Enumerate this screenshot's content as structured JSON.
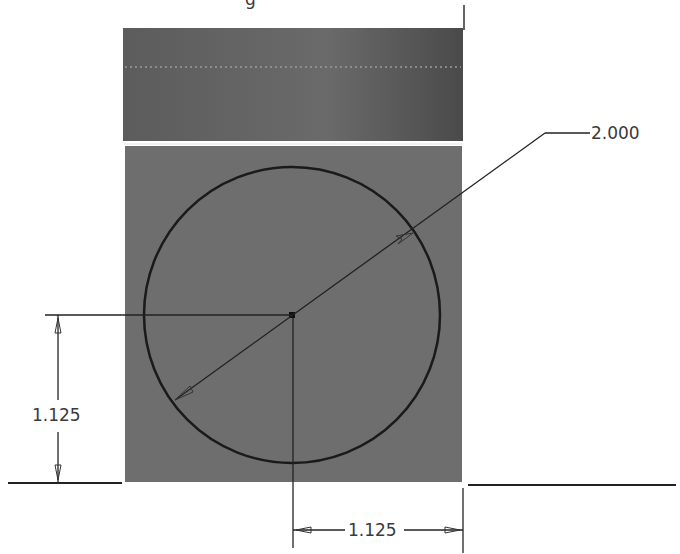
{
  "sketch": {
    "title_fragment": "g",
    "colors": {
      "background": "#ffffff",
      "upper_face": "#5a5a5a",
      "lower_face": "#6e6e6e",
      "lines": "#1e1e1e",
      "dim_text": "#3a3a3a"
    },
    "dimensions": {
      "diameter": {
        "label": "2.000",
        "type": "diameter"
      },
      "vertical": {
        "label": "1.125",
        "type": "linear-vertical"
      },
      "horizontal": {
        "label": "1.125",
        "type": "linear-horizontal"
      }
    },
    "features": {
      "circle": {
        "name": "sketch-circle"
      },
      "center_point": {
        "name": "circle-center-point"
      },
      "upper_face": {
        "name": "upper-face"
      },
      "lower_face": {
        "name": "sketch-plane-face"
      }
    }
  }
}
